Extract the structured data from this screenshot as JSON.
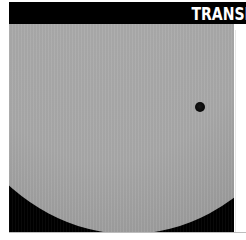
{
  "header": {
    "title": "TRANSI"
  },
  "photo": {
    "subject": "Sun disc with planetary transit",
    "icons": [
      "planet-dot"
    ],
    "colors": {
      "header_bg": "#000000",
      "header_text": "#ffffff",
      "sun": "#a9a9a9",
      "sky": "#000000",
      "planet": "#000000"
    }
  }
}
